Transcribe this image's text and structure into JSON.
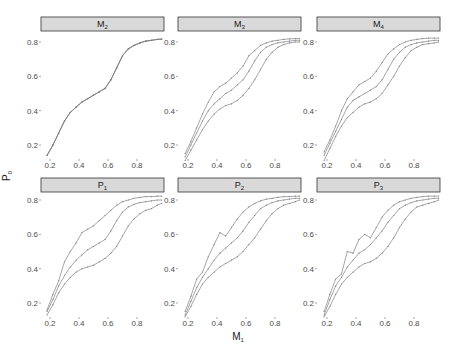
{
  "chart_data": {
    "type": "line",
    "title": "",
    "xlabel": "M1",
    "xlabel_main": "M",
    "xlabel_sub": "1",
    "ylabel": "P0",
    "ylabel_main": "P",
    "ylabel_sub": "0",
    "xlim": [
      0.18,
      0.97
    ],
    "ylim": [
      0.12,
      0.82
    ],
    "x_ticks": [
      0.2,
      0.4,
      0.6,
      0.8
    ],
    "x_tick_labels": [
      "0.2",
      "0.4",
      "0.6",
      "0.8"
    ],
    "y_ticks": [
      0.2,
      0.4,
      0.6,
      0.8
    ],
    "y_tick_labels": [
      "0.2",
      "0.4",
      "0.6",
      "0.8"
    ],
    "grid": false,
    "legend": "none",
    "series_color": "#7f7f7f",
    "x": [
      0.18,
      0.22,
      0.26,
      0.3,
      0.34,
      0.38,
      0.42,
      0.46,
      0.5,
      0.54,
      0.58,
      0.62,
      0.66,
      0.7,
      0.74,
      0.78,
      0.82,
      0.86,
      0.9,
      0.94,
      0.97
    ],
    "panels": [
      {
        "label": "M2",
        "label_main": "M",
        "label_sub": "2",
        "series": [
          {
            "name": "upper",
            "values": [
              0.14,
              0.2,
              0.27,
              0.34,
              0.39,
              0.42,
              0.45,
              0.47,
              0.49,
              0.51,
              0.53,
              0.58,
              0.65,
              0.72,
              0.76,
              0.78,
              0.795,
              0.805,
              0.81,
              0.815,
              0.817
            ]
          },
          {
            "name": "middle",
            "values": [
              0.14,
              0.2,
              0.27,
              0.34,
              0.39,
              0.42,
              0.45,
              0.47,
              0.49,
              0.51,
              0.53,
              0.58,
              0.65,
              0.72,
              0.76,
              0.78,
              0.795,
              0.805,
              0.81,
              0.815,
              0.817
            ]
          },
          {
            "name": "lower",
            "values": [
              0.14,
              0.2,
              0.27,
              0.34,
              0.39,
              0.42,
              0.45,
              0.47,
              0.49,
              0.51,
              0.53,
              0.58,
              0.65,
              0.72,
              0.76,
              0.78,
              0.795,
              0.805,
              0.81,
              0.815,
              0.817
            ]
          }
        ]
      },
      {
        "label": "M3",
        "label_main": "M",
        "label_sub": "3",
        "series": [
          {
            "name": "upper",
            "values": [
              0.15,
              0.22,
              0.3,
              0.38,
              0.45,
              0.51,
              0.54,
              0.56,
              0.59,
              0.62,
              0.66,
              0.72,
              0.75,
              0.78,
              0.795,
              0.805,
              0.81,
              0.815,
              0.818,
              0.82,
              0.82
            ]
          },
          {
            "name": "middle",
            "values": [
              0.13,
              0.2,
              0.27,
              0.34,
              0.4,
              0.44,
              0.47,
              0.5,
              0.52,
              0.55,
              0.58,
              0.63,
              0.69,
              0.74,
              0.77,
              0.785,
              0.795,
              0.8,
              0.805,
              0.81,
              0.81
            ]
          },
          {
            "name": "lower",
            "values": [
              0.11,
              0.17,
              0.23,
              0.29,
              0.34,
              0.38,
              0.41,
              0.43,
              0.44,
              0.46,
              0.49,
              0.53,
              0.58,
              0.64,
              0.7,
              0.74,
              0.77,
              0.785,
              0.795,
              0.8,
              0.8
            ]
          }
        ]
      },
      {
        "label": "M4",
        "label_main": "M",
        "label_sub": "4",
        "series": [
          {
            "name": "upper",
            "values": [
              0.16,
              0.23,
              0.31,
              0.4,
              0.47,
              0.51,
              0.55,
              0.57,
              0.59,
              0.63,
              0.68,
              0.73,
              0.76,
              0.785,
              0.8,
              0.81,
              0.815,
              0.82,
              0.822,
              0.823,
              0.823
            ]
          },
          {
            "name": "middle",
            "values": [
              0.14,
              0.21,
              0.28,
              0.35,
              0.42,
              0.46,
              0.48,
              0.5,
              0.52,
              0.54,
              0.58,
              0.64,
              0.7,
              0.74,
              0.77,
              0.785,
              0.795,
              0.8,
              0.805,
              0.81,
              0.81
            ]
          },
          {
            "name": "lower",
            "values": [
              0.11,
              0.18,
              0.25,
              0.31,
              0.36,
              0.39,
              0.42,
              0.44,
              0.45,
              0.47,
              0.5,
              0.55,
              0.6,
              0.66,
              0.71,
              0.75,
              0.77,
              0.785,
              0.79,
              0.795,
              0.8
            ]
          }
        ]
      },
      {
        "label": "P1",
        "label_main": "P",
        "label_sub": "1",
        "series": [
          {
            "name": "upper",
            "values": [
              0.16,
              0.25,
              0.33,
              0.44,
              0.5,
              0.55,
              0.61,
              0.63,
              0.65,
              0.68,
              0.71,
              0.74,
              0.77,
              0.79,
              0.8,
              0.81,
              0.815,
              0.82,
              0.82,
              0.822,
              0.822
            ]
          },
          {
            "name": "middle",
            "values": [
              0.15,
              0.22,
              0.3,
              0.36,
              0.41,
              0.45,
              0.48,
              0.51,
              0.53,
              0.55,
              0.57,
              0.62,
              0.68,
              0.73,
              0.76,
              0.775,
              0.785,
              0.79,
              0.795,
              0.8,
              0.8
            ]
          },
          {
            "name": "lower",
            "values": [
              0.13,
              0.19,
              0.26,
              0.31,
              0.35,
              0.38,
              0.4,
              0.41,
              0.42,
              0.44,
              0.46,
              0.49,
              0.53,
              0.59,
              0.65,
              0.69,
              0.72,
              0.74,
              0.75,
              0.77,
              0.78
            ]
          }
        ]
      },
      {
        "label": "P2",
        "label_main": "P",
        "label_sub": "2",
        "series": [
          {
            "name": "upper",
            "values": [
              0.15,
              0.24,
              0.34,
              0.38,
              0.47,
              0.54,
              0.61,
              0.59,
              0.64,
              0.69,
              0.73,
              0.76,
              0.78,
              0.795,
              0.805,
              0.81,
              0.815,
              0.82,
              0.82,
              0.822,
              0.822
            ]
          },
          {
            "name": "middle",
            "values": [
              0.13,
              0.21,
              0.29,
              0.35,
              0.4,
              0.45,
              0.49,
              0.52,
              0.55,
              0.58,
              0.62,
              0.67,
              0.71,
              0.75,
              0.77,
              0.785,
              0.795,
              0.8,
              0.805,
              0.81,
              0.81
            ]
          },
          {
            "name": "lower",
            "values": [
              0.12,
              0.18,
              0.25,
              0.31,
              0.35,
              0.38,
              0.41,
              0.43,
              0.45,
              0.47,
              0.5,
              0.54,
              0.58,
              0.63,
              0.68,
              0.72,
              0.75,
              0.77,
              0.78,
              0.79,
              0.8
            ]
          }
        ]
      },
      {
        "label": "P3",
        "label_main": "P",
        "label_sub": "3",
        "series": [
          {
            "name": "upper",
            "values": [
              0.15,
              0.25,
              0.34,
              0.37,
              0.5,
              0.49,
              0.57,
              0.6,
              0.58,
              0.64,
              0.7,
              0.74,
              0.77,
              0.79,
              0.8,
              0.81,
              0.815,
              0.82,
              0.822,
              0.823,
              0.823
            ]
          },
          {
            "name": "middle",
            "values": [
              0.13,
              0.22,
              0.3,
              0.35,
              0.41,
              0.45,
              0.49,
              0.51,
              0.54,
              0.58,
              0.62,
              0.67,
              0.71,
              0.75,
              0.77,
              0.785,
              0.795,
              0.8,
              0.805,
              0.81,
              0.81
            ]
          },
          {
            "name": "lower",
            "values": [
              0.12,
              0.18,
              0.25,
              0.31,
              0.35,
              0.38,
              0.41,
              0.43,
              0.44,
              0.46,
              0.49,
              0.53,
              0.58,
              0.64,
              0.69,
              0.73,
              0.76,
              0.77,
              0.78,
              0.79,
              0.8
            ]
          }
        ]
      }
    ]
  }
}
